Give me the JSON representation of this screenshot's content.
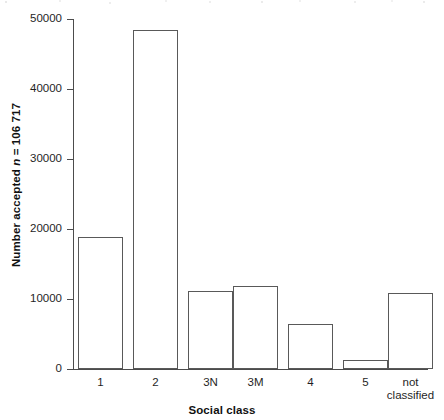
{
  "chart_data": {
    "type": "bar",
    "title": "",
    "xlabel": "Social class",
    "ylabel": "Number accepted n = 106 717",
    "ylabel_parts": {
      "bold_text": "Number accepted",
      "italic_symbol": "n",
      "equals": "=",
      "total": "106 717"
    },
    "categories": [
      "1",
      "2",
      "3N",
      "3M",
      "4",
      "5",
      "not\nclassified"
    ],
    "category_labels_flat": [
      "1",
      "2",
      "3N",
      "3M",
      "4",
      "5",
      "not classified"
    ],
    "values": [
      18800,
      48400,
      11200,
      11800,
      6400,
      1300,
      10800
    ],
    "ylim": [
      0,
      50000
    ],
    "yticks": [
      0,
      10000,
      20000,
      30000,
      40000,
      50000
    ],
    "ytick_labels": [
      "0",
      "10000",
      "20000",
      "30000",
      "40000",
      "50000"
    ],
    "grid": false,
    "legend": false,
    "bar_fill_color": "#ffffff",
    "bar_edge_color": "#595959",
    "axis_color": "#4c4c4c",
    "background_color": "#ffffff"
  },
  "layout": {
    "plot_left_px": 73,
    "plot_baseline_px": 369,
    "plot_top_px": 19,
    "px_per_unit": 0.00698,
    "bar_left_positions_px": [
      78,
      133,
      188,
      243,
      298,
      343,
      388
    ],
    "bar_width_px": 45,
    "bar_left_positions_actual_px": [
      78,
      133,
      188,
      233,
      288,
      343,
      388
    ],
    "ytick_y_px": [
      369,
      299,
      229,
      159,
      89,
      19
    ]
  }
}
